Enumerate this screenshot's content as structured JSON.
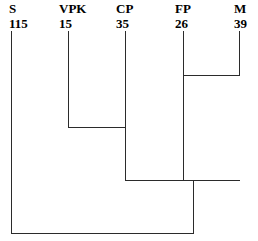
{
  "figure": {
    "type": "cladogram",
    "line_color": "#2b2b2b",
    "background_color": "#ffffff",
    "width": 258,
    "height": 241
  },
  "taxa": [
    {
      "abbr": "S",
      "count": "115",
      "label_x": 9,
      "tip_x": 11
    },
    {
      "abbr": "VPK",
      "count": "15",
      "label_x": 59,
      "tip_x": 68
    },
    {
      "abbr": "CP",
      "count": "35",
      "label_x": 116,
      "tip_x": 125
    },
    {
      "abbr": "FP",
      "count": "26",
      "label_x": 175,
      "tip_x": 183
    },
    {
      "abbr": "M",
      "count": "39",
      "label_x": 234,
      "tip_x": 239
    }
  ],
  "chart_data": {
    "type": "tree",
    "title": "",
    "xlabel": "",
    "ylabel": "",
    "leaves": [
      {
        "name": "S",
        "value": 115
      },
      {
        "name": "VPK",
        "value": 15
      },
      {
        "name": "CP",
        "value": 35
      },
      {
        "name": "FP",
        "value": 26
      },
      {
        "name": "M",
        "value": 39
      }
    ],
    "tip_y": 31,
    "nodes": [
      {
        "id": "n1",
        "children": [
          "FP",
          "M"
        ],
        "join_y": 75,
        "x_left": 183,
        "x_right": 239,
        "stem_x": 183
      },
      {
        "id": "n2",
        "children": [
          "VPK",
          "CP"
        ],
        "join_y": 127,
        "x_left": 68,
        "x_right": 125,
        "stem_x": 125
      },
      {
        "id": "n3",
        "children": [
          "n2",
          "n1"
        ],
        "join_y": 180,
        "x_left": 125,
        "x_right": 239,
        "stem_x": 193
      },
      {
        "id": "n4",
        "children": [
          "S",
          "n3"
        ],
        "join_y": 233,
        "x_left": 11,
        "x_right": 193,
        "stem_x": null
      }
    ]
  }
}
